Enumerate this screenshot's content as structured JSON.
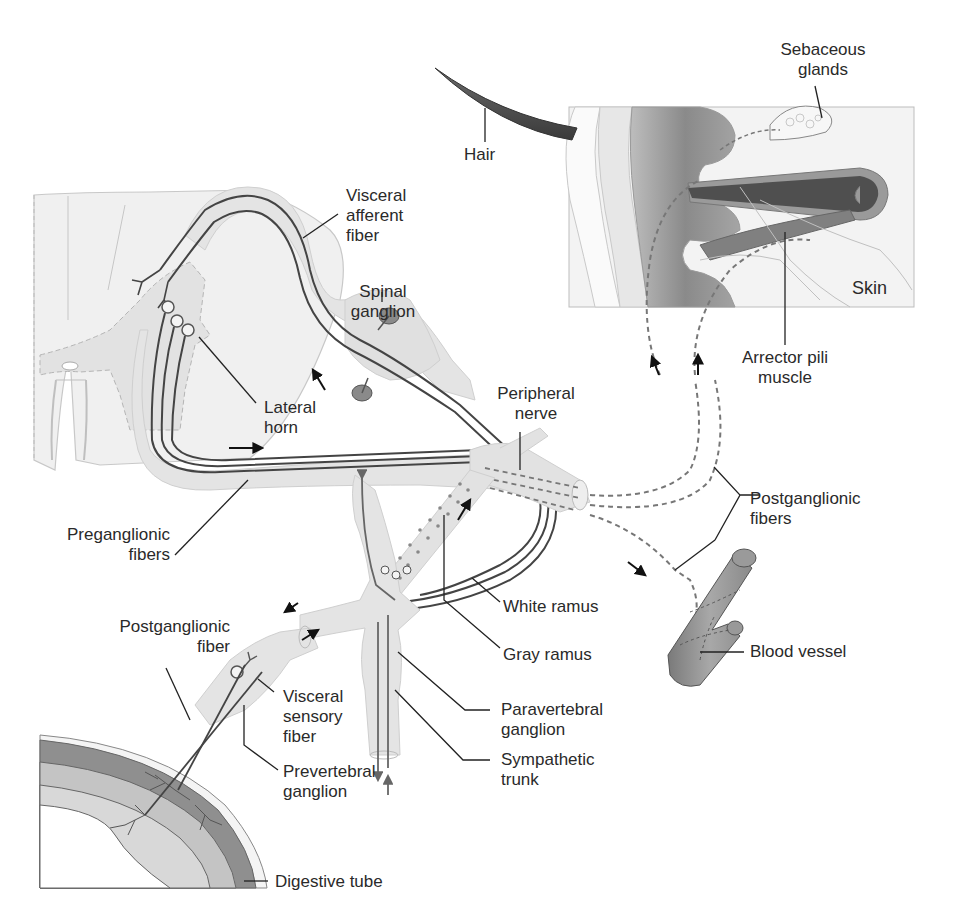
{
  "figure": {
    "type": "anatomical-diagram",
    "colors": {
      "background": "#ffffff",
      "tissue_light": "#ececec",
      "tissue_mid": "#d9d9d9",
      "nerve_sheath": "#e2e2e2",
      "fiber_line": "#555555",
      "dermis_dark": "#8f8f8f",
      "muscle": "#666666",
      "label_text": "#2a2a2a",
      "leader_line": "#222222"
    }
  },
  "labels": {
    "sebaceous_glands": "Sebaceous\nglands",
    "hair": "Hair",
    "visceral_afferent_fiber": "Visceral\nafferent\nfiber",
    "spinal_ganglion": "Spinal\nganglion",
    "skin": "Skin",
    "arrector_pili_muscle": "Arrector pili\nmuscle",
    "lateral_horn": "Lateral\nhorn",
    "peripheral_nerve": "Peripheral\nnerve",
    "postganglionic_fibers": "Postganglionic\nfibers",
    "preganglionic_fibers": "Preganglionic\nfibers",
    "white_ramus": "White ramus",
    "gray_ramus": "Gray ramus",
    "blood_vessel": "Blood vessel",
    "postganglionic_fiber": "Postganglionic\nfiber",
    "visceral_sensory_fiber": "Visceral\nsensory\nfiber",
    "paravertebral_ganglion": "Paravertebral\nganglion",
    "prevertebral_ganglion": "Prevertebral\nganglion",
    "sympathetic_trunk": "Sympathetic\ntrunk",
    "digestive_tube": "Digestive tube"
  }
}
